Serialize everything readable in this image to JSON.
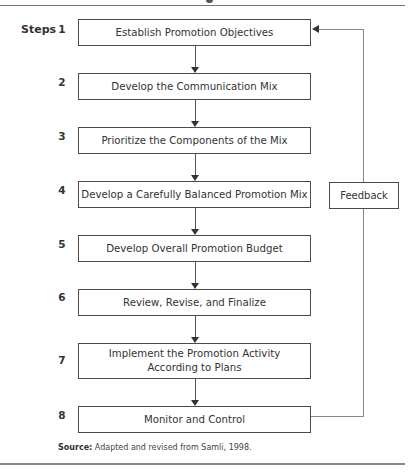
{
  "diagram": {
    "type": "flowchart",
    "steps_label": "Steps",
    "steps": [
      {
        "number": "1",
        "label_lines": [
          "Establish Promotion Objectives"
        ]
      },
      {
        "number": "2",
        "label_lines": [
          "Develop the Communication Mix"
        ]
      },
      {
        "number": "3",
        "label_lines": [
          "Prioritize the Components of the Mix"
        ]
      },
      {
        "number": "4",
        "label_lines": [
          "Develop a Carefully Balanced Promotion Mix"
        ]
      },
      {
        "number": "5",
        "label_lines": [
          "Develop Overall Promotion Budget"
        ]
      },
      {
        "number": "6",
        "label_lines": [
          "Review, Revise, and Finalize"
        ]
      },
      {
        "number": "7",
        "label_lines": [
          "Implement the Promotion Activity",
          "According to Plans"
        ]
      },
      {
        "number": "8",
        "label_lines": [
          "Monitor and Control"
        ]
      }
    ],
    "feedback": {
      "label": "Feedback",
      "from_step": "8",
      "to_step": "1"
    },
    "source": {
      "prefix": "Source:",
      "text": "Adapted and revised from Samli, 1998."
    },
    "colors": {
      "box_border": "#4a4a4a",
      "text": "#333333",
      "feedback_line": "#888888",
      "background": "#ffffff"
    }
  }
}
